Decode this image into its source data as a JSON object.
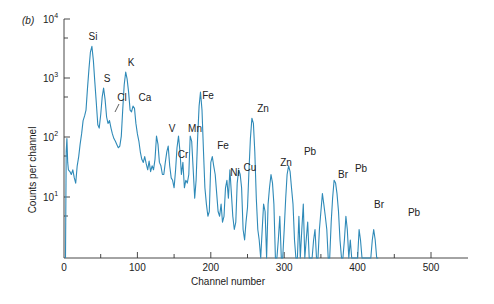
{
  "chart_data": {
    "type": "line",
    "panel_label": "(b)",
    "title": "",
    "xlabel": "Channel number",
    "ylabel": "Counts per channel",
    "xlim": [
      0,
      550
    ],
    "ylim": [
      1,
      10000
    ],
    "yscale": "log",
    "x_ticks": [
      0,
      100,
      200,
      300,
      400,
      500
    ],
    "x_minor_ticks": [
      50,
      150,
      250,
      350,
      450
    ],
    "y_ticks": [
      "10^1",
      "10^2",
      "10^3",
      "10^4"
    ],
    "grid": false,
    "legend": null,
    "color": "#2f8ab8",
    "peaks": [
      {
        "label": "Si",
        "channel": 40,
        "counts": 3500
      },
      {
        "label": "S",
        "channel": 58,
        "counts": 700
      },
      {
        "label": "Cl",
        "channel": 70,
        "counts": 200
      },
      {
        "label": "K",
        "channel": 91,
        "counts": 1300
      },
      {
        "label": "Ca",
        "channel": 101,
        "counts": 350
      },
      {
        "label": "V",
        "channel": 148,
        "counts": 110
      },
      {
        "label": "Cr",
        "channel": 163,
        "counts": 35
      },
      {
        "label": "Mn",
        "channel": 178,
        "counts": 110
      },
      {
        "label": "Fe",
        "channel": 196,
        "counts": 600
      },
      {
        "label": "Fe",
        "channel": 219,
        "counts": 50
      },
      {
        "label": "Ni",
        "channel": 233,
        "counts": 25
      },
      {
        "label": "Cu",
        "channel": 251,
        "counts": 30
      },
      {
        "label": "Zn",
        "channel": 272,
        "counts": 220
      },
      {
        "label": "Zn",
        "channel": 301,
        "counts": 25
      },
      {
        "label": "Pb",
        "channel": 334,
        "counts": 35
      },
      {
        "label": "Br",
        "channel": 378,
        "counts": 12
      },
      {
        "label": "Pb",
        "channel": 404,
        "counts": 20
      },
      {
        "label": "Br",
        "channel": 428,
        "counts": 5
      },
      {
        "label": "Pb",
        "channel": 476,
        "counts": 3
      }
    ],
    "series": [
      {
        "name": "X-ray spectrum",
        "x": [
          2,
          3,
          4,
          5,
          6,
          8,
          10,
          12,
          14,
          16,
          18,
          20,
          22,
          24,
          26,
          28,
          30,
          32,
          34,
          36,
          38,
          40,
          42,
          44,
          46,
          48,
          50,
          52,
          54,
          56,
          58,
          60,
          62,
          64,
          66,
          68,
          70,
          72,
          74,
          76,
          78,
          80,
          82,
          84,
          86,
          88,
          90,
          92,
          94,
          96,
          98,
          100,
          102,
          104,
          106,
          108,
          110,
          112,
          114,
          116,
          118,
          120,
          122,
          124,
          126,
          128,
          130,
          132,
          134,
          136,
          138,
          140,
          142,
          144,
          146,
          148,
          150,
          152,
          154,
          156,
          158,
          160,
          162,
          164,
          166,
          168,
          170,
          172,
          174,
          176,
          178,
          180,
          182,
          184,
          186,
          188,
          190,
          192,
          194,
          196,
          198,
          200,
          202,
          204,
          206,
          208,
          210,
          212,
          214,
          216,
          218,
          220,
          222,
          224,
          226,
          228,
          230,
          232,
          234,
          236,
          238,
          240,
          242,
          244,
          246,
          248,
          250,
          252,
          254,
          256,
          258,
          260,
          262,
          264,
          266,
          268,
          270,
          272,
          274,
          276,
          278,
          280,
          282,
          284,
          286,
          288,
          290,
          292,
          294,
          296,
          298,
          300,
          302,
          304,
          306,
          308,
          310,
          312,
          314,
          316,
          318,
          320,
          322,
          324,
          326,
          328,
          330,
          332,
          334,
          336,
          338,
          340,
          342,
          344,
          346,
          348,
          350,
          352,
          354,
          356,
          358,
          360,
          362,
          364,
          366,
          368,
          370,
          372,
          374,
          376,
          378,
          380,
          382,
          384,
          386,
          388,
          390,
          392,
          394,
          396,
          398,
          400,
          402,
          404,
          406,
          408,
          410,
          412,
          414,
          416,
          418,
          420,
          422,
          424,
          426,
          428,
          430,
          432,
          434,
          436,
          438,
          440,
          442,
          444,
          446,
          448,
          450,
          452,
          454,
          456,
          458,
          460,
          462,
          464,
          466,
          468,
          470,
          472,
          474,
          476,
          478,
          480
        ],
        "counts": [
          1,
          60,
          100,
          40,
          30,
          28,
          25,
          30,
          22,
          18,
          35,
          50,
          80,
          120,
          200,
          240,
          300,
          700,
          1500,
          2800,
          3500,
          2000,
          900,
          400,
          170,
          150,
          250,
          500,
          700,
          450,
          230,
          180,
          200,
          150,
          120,
          100,
          90,
          80,
          70,
          75,
          110,
          300,
          800,
          1300,
          1000,
          600,
          300,
          280,
          350,
          320,
          180,
          120,
          90,
          60,
          45,
          40,
          50,
          38,
          30,
          42,
          28,
          35,
          30,
          45,
          110,
          80,
          40,
          35,
          25,
          25,
          40,
          60,
          75,
          35,
          22,
          20,
          15,
          30,
          70,
          110,
          60,
          25,
          40,
          15,
          20,
          18,
          25,
          110,
          90,
          30,
          10,
          20,
          100,
          350,
          600,
          300,
          60,
          15,
          8,
          5,
          6,
          40,
          50,
          35,
          25,
          12,
          6,
          5,
          8,
          4,
          5,
          15,
          20,
          10,
          30,
          12,
          5,
          3,
          4,
          18,
          30,
          25,
          15,
          3,
          2,
          4,
          7,
          30,
          100,
          220,
          180,
          60,
          10,
          3,
          2,
          1,
          3,
          8,
          6,
          1,
          8,
          15,
          25,
          18,
          8,
          1,
          1,
          2,
          5,
          1,
          1,
          3,
          10,
          25,
          35,
          28,
          15,
          8,
          2,
          1,
          1,
          5,
          1,
          3,
          8,
          1,
          2,
          4,
          1,
          1,
          1,
          2,
          3,
          1,
          1,
          3,
          6,
          12,
          8,
          5,
          3,
          1,
          1,
          4,
          10,
          20,
          18,
          12,
          6,
          2,
          1,
          1,
          2,
          5,
          3,
          1,
          2,
          1,
          1,
          1,
          1,
          1,
          3,
          2,
          1,
          1,
          1,
          1,
          1,
          1,
          1,
          2,
          3,
          2,
          1,
          1
        ]
      }
    ]
  },
  "texts": {
    "panel_label": "(b)",
    "ylabel": "Counts per channel",
    "xlabel": "Channel number",
    "y_tick_1": "10",
    "y_tick_1_exp": "1",
    "y_tick_2": "10",
    "y_tick_2_exp": "2",
    "y_tick_3": "10",
    "y_tick_3_exp": "3",
    "y_tick_4": "10",
    "y_tick_4_exp": "4",
    "x_tick_0": "0",
    "x_tick_100": "100",
    "x_tick_200": "200",
    "x_tick_300": "300",
    "x_tick_400": "400",
    "x_tick_500": "500"
  },
  "peak_labels": [
    {
      "text": "Si",
      "x": 93,
      "y": 40
    },
    {
      "text": "S",
      "x": 107,
      "y": 82
    },
    {
      "text": "Cl",
      "x": 122,
      "y": 101
    },
    {
      "text": "K",
      "x": 131,
      "y": 66
    },
    {
      "text": "Ca",
      "x": 145,
      "y": 101
    },
    {
      "text": "V",
      "x": 172,
      "y": 132
    },
    {
      "text": "Cr",
      "x": 183,
      "y": 158
    },
    {
      "text": "Mn",
      "x": 195,
      "y": 132
    },
    {
      "text": "Fe",
      "x": 208,
      "y": 99
    },
    {
      "text": "Fe",
      "x": 223,
      "y": 149
    },
    {
      "text": "Ni",
      "x": 235,
      "y": 176
    },
    {
      "text": "Cu",
      "x": 250,
      "y": 171
    },
    {
      "text": "Zn",
      "x": 263,
      "y": 112
    },
    {
      "text": "Zn",
      "x": 286,
      "y": 166
    },
    {
      "text": "Pb",
      "x": 310,
      "y": 155
    },
    {
      "text": "Br",
      "x": 343,
      "y": 178
    },
    {
      "text": "Pb",
      "x": 361,
      "y": 172
    },
    {
      "text": "Br",
      "x": 379,
      "y": 208
    },
    {
      "text": "Pb",
      "x": 414,
      "y": 216
    }
  ]
}
